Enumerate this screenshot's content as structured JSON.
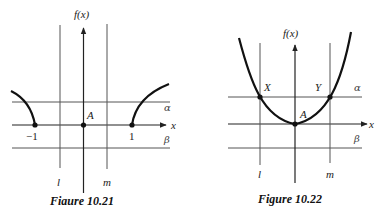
{
  "figures": [
    {
      "id": "fig-10-21",
      "caption": "Fiaure 10.21",
      "y_axis_label": "f(x)",
      "x_axis_label": "x",
      "line_labels": {
        "alpha": "α",
        "beta": "β",
        "l": "l",
        "m": "m"
      },
      "point_labels": {
        "A": "A",
        "neg_one": "−1",
        "one": "1"
      },
      "description": "Two curve branches rising from x = −1 and x = 1; point A at origin; vertical lines l and m; horizontal lines α (above axis) and β (below axis)"
    },
    {
      "id": "fig-10-22",
      "caption": "Figure 10.22",
      "y_axis_label": "f(x)",
      "x_axis_label": "x",
      "line_labels": {
        "alpha": "α",
        "beta": "β",
        "l": "l",
        "m": "m"
      },
      "point_labels": {
        "A": "A",
        "X": "X",
        "Y": "Y"
      },
      "description": "Upward parabola with vertex A at origin, intersecting line α at X (on line l) and Y (on line m)"
    }
  ],
  "colors": {
    "ink": "#111111",
    "grid": "#555555",
    "background": "#ffffff"
  }
}
